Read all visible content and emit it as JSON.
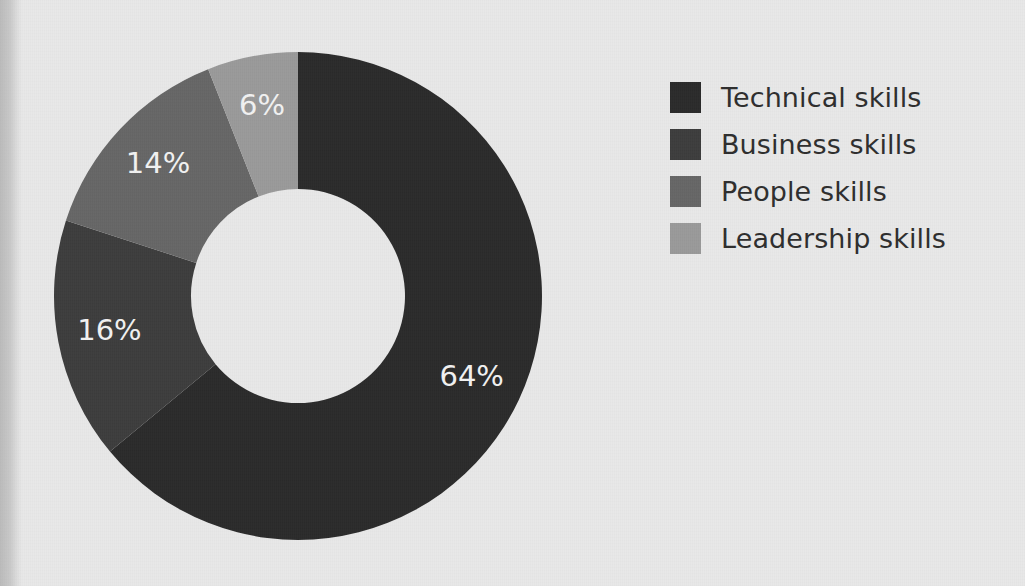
{
  "page": {
    "background_color": "#e8e8e8",
    "gutter_shadow": true
  },
  "chart_data": {
    "type": "pie",
    "variant": "donut",
    "title": "",
    "subtitle": "",
    "xlabel": "",
    "ylabel": "",
    "grid": false,
    "legend_position": "right",
    "units": "percent",
    "total": 100,
    "start_angle_deg": 0,
    "direction": "clockwise",
    "center": {
      "x": 298,
      "y": 296
    },
    "outer_radius": 244,
    "inner_radius": 107,
    "categories": [
      "Technical skills",
      "Business skills",
      "People skills",
      "Leadership skills"
    ],
    "values": [
      64,
      16,
      14,
      6
    ],
    "labels": [
      "64%",
      "16%",
      "14%",
      "6%"
    ],
    "colors": [
      "#2b2b2b",
      "#3d3d3d",
      "#666666",
      "#9a9a9a"
    ],
    "slices": [
      {
        "name": "Technical skills",
        "value": 64,
        "label": "64%",
        "color": "#2b2b2b",
        "label_color": "#f2f2f2"
      },
      {
        "name": "Business skills",
        "value": 16,
        "label": "16%",
        "color": "#3d3d3d",
        "label_color": "#f2f2f2"
      },
      {
        "name": "People skills",
        "value": 14,
        "label": "14%",
        "color": "#666666",
        "label_color": "#f2f2f2"
      },
      {
        "name": "Leadership skills",
        "value": 6,
        "label": "6%",
        "color": "#9a9a9a",
        "label_color": "#f2f2f2"
      }
    ]
  },
  "legend": {
    "items": [
      {
        "label": "Technical skills",
        "color": "#2b2b2b"
      },
      {
        "label": "Business skills",
        "color": "#3d3d3d"
      },
      {
        "label": "People skills",
        "color": "#666666"
      },
      {
        "label": "Leadership skills",
        "color": "#9a9a9a"
      }
    ]
  }
}
